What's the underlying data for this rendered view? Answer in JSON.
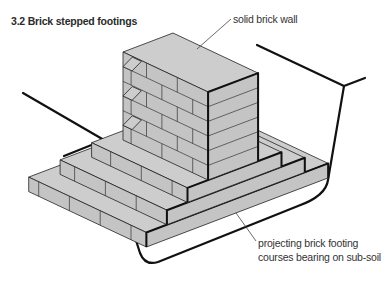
{
  "figure": {
    "title": "3.2  Brick stepped footings",
    "labels": {
      "wall": "solid brick wall",
      "footing_line1": "projecting brick footing",
      "footing_line2": "courses bearing on sub-soil"
    },
    "footing_tiers": 3,
    "colors": {
      "brick_face": "#c4c4c4",
      "brick_top": "#cdcdcd",
      "line": "#111111"
    }
  }
}
